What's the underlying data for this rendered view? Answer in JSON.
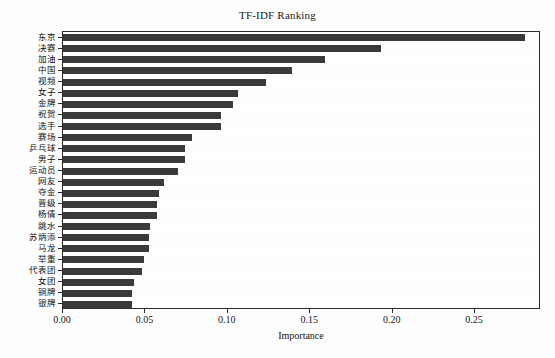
{
  "chart_data": {
    "type": "bar",
    "orientation": "horizontal",
    "title": "TF-IDF Ranking",
    "xlabel": "Importance",
    "ylabel": "",
    "xlim": [
      0.0,
      0.29
    ],
    "xticks": [
      "0.00",
      "0.05",
      "0.10",
      "0.15",
      "0.20",
      "0.25"
    ],
    "xtick_values": [
      0.0,
      0.05,
      0.1,
      0.15,
      0.2,
      0.25
    ],
    "grid": false,
    "legend": null,
    "bar_color": "#3a3a3a",
    "categories": [
      "东京",
      "决赛",
      "加油",
      "中国",
      "视频",
      "女子",
      "金牌",
      "祝贺",
      "选手",
      "赛场",
      "乒乓球",
      "男子",
      "运动员",
      "网友",
      "夺金",
      "晋级",
      "杨倩",
      "跳水",
      "苏炳添",
      "马龙",
      "举重",
      "代表团",
      "女团",
      "铜牌",
      "银牌"
    ],
    "values": [
      0.28,
      0.193,
      0.159,
      0.139,
      0.123,
      0.106,
      0.103,
      0.096,
      0.096,
      0.078,
      0.074,
      0.074,
      0.07,
      0.061,
      0.058,
      0.057,
      0.057,
      0.053,
      0.052,
      0.052,
      0.049,
      0.048,
      0.043,
      0.042,
      0.042
    ]
  }
}
